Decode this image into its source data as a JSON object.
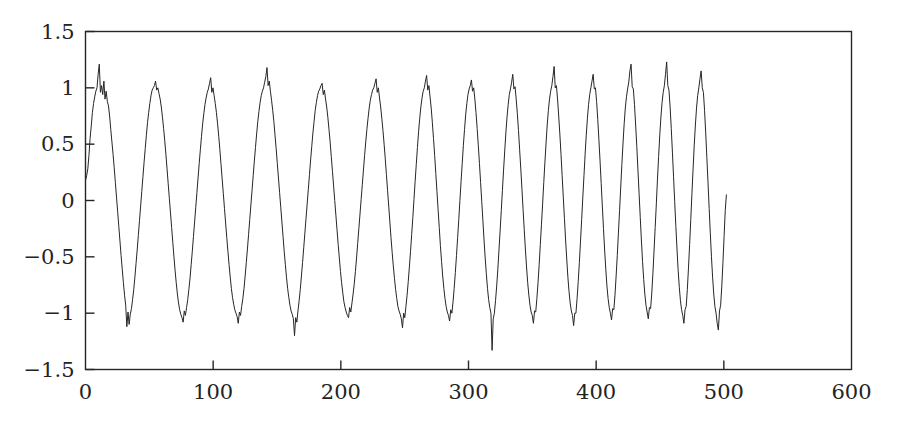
{
  "chart_data": {
    "type": "line",
    "title": "",
    "subtitle": "",
    "xlabel": "",
    "ylabel": "",
    "xlim": [
      0,
      600
    ],
    "ylim": [
      -1.5,
      1.5
    ],
    "xticks": [
      0,
      100,
      200,
      300,
      400,
      500,
      600
    ],
    "xtick_labels": [
      "0",
      "100",
      "200",
      "300",
      "400",
      "500",
      "600"
    ],
    "yticks": [
      -1.5,
      -1,
      -0.5,
      0,
      0.5,
      1,
      1.5
    ],
    "ytick_labels": [
      "-1.5",
      "-1",
      "-0.5",
      "0",
      "0.5",
      "1",
      "1.5"
    ],
    "grid": false,
    "legend": null,
    "legend_position": "none",
    "line_color": "#262626",
    "line_width": 1,
    "axis_color": "#262626",
    "background_color": "#ffffff",
    "series": [
      {
        "name": "signal",
        "x_start": 0,
        "x_end": 502,
        "x_step": 1,
        "peaks_x": [
          12,
          61,
          111,
          162,
          211,
          262,
          301,
          328,
          355,
          383,
          409,
          434,
          459,
          484
        ],
        "peaks_y": [
          1.21,
          1.06,
          1.09,
          1.18,
          1.04,
          1.08,
          1.11,
          1.07,
          1.12,
          1.19,
          1.12,
          1.21,
          1.23,
          1.15
        ],
        "troughs_x": [
          36,
          86,
          137,
          187,
          237,
          287,
          316,
          342,
          369,
          396,
          422,
          447,
          472,
          496
        ],
        "troughs_y": [
          -1.12,
          -1.08,
          -1.09,
          -1.2,
          -1.04,
          -1.13,
          -1.07,
          -1.33,
          -1.09,
          -1.11,
          -1.06,
          -1.05,
          -1.09,
          -1.15
        ],
        "values": [
          0.18,
          0.22,
          0.28,
          0.4,
          0.55,
          0.66,
          0.78,
          0.86,
          0.92,
          0.97,
          1.0,
          1.12,
          1.21,
          0.96,
          1.02,
          0.94,
          1.06,
          0.9,
          0.97,
          0.88,
          0.84,
          0.75,
          0.63,
          0.52,
          0.41,
          0.29,
          0.16,
          0.03,
          -0.1,
          -0.23,
          -0.36,
          -0.49,
          -0.61,
          -0.73,
          -0.84,
          -0.93,
          -1.12,
          -0.99,
          -1.1,
          -1.01,
          -0.96,
          -0.88,
          -0.79,
          -0.68,
          -0.56,
          -0.44,
          -0.31,
          -0.18,
          -0.05,
          0.08,
          0.21,
          0.34,
          0.46,
          0.58,
          0.69,
          0.78,
          0.86,
          0.93,
          0.98,
          1.0,
          1.02,
          1.06,
          0.98,
          1.0,
          0.95,
          0.9,
          0.83,
          0.74,
          0.64,
          0.53,
          0.41,
          0.28,
          0.15,
          0.02,
          -0.11,
          -0.24,
          -0.37,
          -0.5,
          -0.62,
          -0.73,
          -0.83,
          -0.91,
          -0.97,
          -1.01,
          -1.04,
          -1.08,
          -0.98,
          -1.02,
          -0.95,
          -0.88,
          -0.79,
          -0.69,
          -0.57,
          -0.45,
          -0.32,
          -0.19,
          -0.06,
          0.07,
          0.2,
          0.33,
          0.45,
          0.57,
          0.68,
          0.77,
          0.85,
          0.91,
          0.96,
          0.99,
          1.04,
          1.09,
          0.96,
          1.0,
          0.93,
          0.86,
          0.78,
          0.68,
          0.57,
          0.45,
          0.32,
          0.19,
          0.06,
          -0.07,
          -0.2,
          -0.33,
          -0.45,
          -0.57,
          -0.68,
          -0.78,
          -0.86,
          -0.92,
          -0.97,
          -1.0,
          -1.03,
          -1.09,
          -0.99,
          -1.02,
          -0.94,
          -0.87,
          -0.78,
          -0.67,
          -0.55,
          -0.43,
          -0.3,
          -0.17,
          -0.04,
          0.09,
          0.22,
          0.35,
          0.47,
          0.59,
          0.7,
          0.79,
          0.87,
          0.93,
          0.97,
          1.0,
          1.05,
          1.1,
          1.18,
          1.02,
          1.06,
          0.97,
          0.89,
          0.8,
          0.7,
          0.58,
          0.46,
          0.33,
          0.2,
          0.07,
          -0.06,
          -0.19,
          -0.32,
          -0.45,
          -0.57,
          -0.68,
          -0.78,
          -0.86,
          -0.93,
          -0.98,
          -1.01,
          -1.05,
          -1.2,
          -1.04,
          -1.08,
          -0.98,
          -0.89,
          -0.79,
          -0.67,
          -0.55,
          -0.42,
          -0.29,
          -0.16,
          -0.03,
          0.1,
          0.23,
          0.36,
          0.48,
          0.6,
          0.7,
          0.8,
          0.87,
          0.93,
          0.97,
          0.99,
          1.02,
          1.04,
          0.94,
          0.98,
          0.9,
          0.83,
          0.74,
          0.63,
          0.52,
          0.39,
          0.26,
          0.13,
          0.0,
          -0.13,
          -0.26,
          -0.39,
          -0.51,
          -0.63,
          -0.73,
          -0.82,
          -0.9,
          -0.95,
          -0.99,
          -1.02,
          -1.04,
          -0.95,
          -0.99,
          -0.91,
          -0.83,
          -0.74,
          -0.63,
          -0.51,
          -0.38,
          -0.25,
          -0.12,
          0.01,
          0.14,
          0.27,
          0.4,
          0.52,
          0.63,
          0.73,
          0.82,
          0.89,
          0.94,
          0.98,
          1.0,
          1.04,
          1.08,
          0.96,
          1.0,
          0.91,
          0.83,
          0.73,
          0.62,
          0.5,
          0.37,
          0.23,
          0.09,
          -0.05,
          -0.19,
          -0.33,
          -0.46,
          -0.58,
          -0.69,
          -0.79,
          -0.87,
          -0.94,
          -0.98,
          -1.01,
          -1.05,
          -1.13,
          -1.0,
          -1.04,
          -0.94,
          -0.84,
          -0.72,
          -0.59,
          -0.45,
          -0.3,
          -0.15,
          0.01,
          0.17,
          0.32,
          0.47,
          0.61,
          0.73,
          0.83,
          0.91,
          0.97,
          1.0,
          1.06,
          1.11,
          0.98,
          1.02,
          0.92,
          0.82,
          0.69,
          0.55,
          0.4,
          0.24,
          0.08,
          -0.08,
          -0.24,
          -0.4,
          -0.54,
          -0.67,
          -0.78,
          -0.87,
          -0.94,
          -0.99,
          -1.02,
          -1.07,
          -0.97,
          -1.0,
          -0.9,
          -0.78,
          -0.64,
          -0.49,
          -0.33,
          -0.17,
          0.0,
          0.17,
          0.33,
          0.49,
          0.63,
          0.76,
          0.86,
          0.94,
          0.99,
          1.02,
          1.07,
          0.97,
          1.0,
          0.9,
          0.78,
          0.64,
          0.49,
          0.33,
          0.16,
          -0.01,
          -0.18,
          -0.35,
          -0.51,
          -0.65,
          -0.78,
          -0.88,
          -0.95,
          -1.0,
          -1.33,
          -1.05,
          -1.0,
          -0.89,
          -0.76,
          -0.61,
          -0.44,
          -0.27,
          -0.09,
          0.09,
          0.27,
          0.44,
          0.6,
          0.74,
          0.85,
          0.94,
          0.99,
          1.05,
          1.12,
          0.99,
          1.01,
          0.9,
          0.77,
          0.62,
          0.45,
          0.28,
          0.1,
          -0.08,
          -0.26,
          -0.43,
          -0.59,
          -0.73,
          -0.84,
          -0.93,
          -0.99,
          -1.02,
          -1.09,
          -0.98,
          -0.99,
          -0.87,
          -0.73,
          -0.57,
          -0.39,
          -0.21,
          -0.03,
          0.16,
          0.34,
          0.51,
          0.67,
          0.8,
          0.9,
          0.97,
          1.02,
          1.1,
          1.19,
          1.0,
          1.02,
          0.9,
          0.75,
          0.59,
          0.41,
          0.22,
          0.03,
          -0.16,
          -0.35,
          -0.52,
          -0.68,
          -0.81,
          -0.91,
          -0.98,
          -1.02,
          -1.11,
          -1.0,
          -1.0,
          -0.87,
          -0.72,
          -0.55,
          -0.36,
          -0.17,
          0.03,
          0.22,
          0.41,
          0.58,
          0.73,
          0.85,
          0.94,
          1.0,
          1.06,
          1.12,
          0.99,
          1.0,
          0.88,
          0.72,
          0.54,
          0.35,
          0.15,
          -0.05,
          -0.25,
          -0.44,
          -0.61,
          -0.76,
          -0.87,
          -0.95,
          -1.0,
          -1.06,
          -0.96,
          -0.97,
          -0.84,
          -0.67,
          -0.49,
          -0.29,
          -0.09,
          0.12,
          0.32,
          0.51,
          0.68,
          0.82,
          0.92,
          0.99,
          1.05,
          1.15,
          1.21,
          1.01,
          0.99,
          0.85,
          0.67,
          0.48,
          0.27,
          0.06,
          -0.15,
          -0.35,
          -0.54,
          -0.7,
          -0.83,
          -0.93,
          -0.99,
          -1.05,
          -0.95,
          -0.96,
          -0.83,
          -0.65,
          -0.45,
          -0.24,
          -0.03,
          0.19,
          0.39,
          0.58,
          0.74,
          0.87,
          0.96,
          1.02,
          1.12,
          1.23,
          1.02,
          0.98,
          0.83,
          0.64,
          0.43,
          0.21,
          -0.01,
          -0.23,
          -0.43,
          -0.62,
          -0.77,
          -0.89,
          -0.97,
          -1.02,
          -1.09,
          -0.97,
          -0.94,
          -0.79,
          -0.6,
          -0.39,
          -0.17,
          0.06,
          0.28,
          0.49,
          0.67,
          0.82,
          0.93,
          1.0,
          1.08,
          1.15,
          1.0,
          0.96,
          0.8,
          0.6,
          0.38,
          0.16,
          -0.07,
          -0.29,
          -0.5,
          -0.68,
          -0.83,
          -0.94,
          -1.0,
          -1.09,
          -1.15,
          -0.98,
          -0.93,
          -0.76,
          -0.55,
          -0.32,
          -0.09,
          0.05
        ]
      }
    ]
  }
}
